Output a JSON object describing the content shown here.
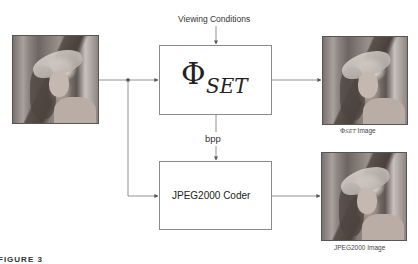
{
  "diagram": {
    "input_image": {
      "alt": "Lena input image"
    },
    "top_input_label": "Viewing Conditions",
    "phi_block": {
      "symbol": "Φ",
      "subscript": "SET"
    },
    "middle_label": "bpp",
    "jpeg_block": {
      "label": "JPEG2000 Coder"
    },
    "output_phi": {
      "caption_symbol": "Φ",
      "caption_subscript": "SET",
      "caption_suffix": " Image"
    },
    "output_jpeg": {
      "caption": "JPEG2000 Image"
    },
    "figure_label": "FIGURE 3"
  },
  "colors": {
    "line": "#666666",
    "box_border": "#8a8a8a",
    "text": "#333333"
  }
}
